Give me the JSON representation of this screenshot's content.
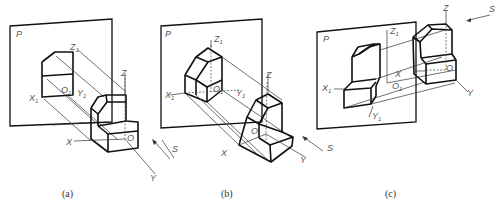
{
  "figure": {
    "panels": [
      {
        "id": "a",
        "caption": "(a)",
        "plane_label": "P",
        "axes_3d": {
          "x": "X",
          "y": "Y",
          "z": "Z",
          "origin": "O"
        },
        "axes_projected": {
          "x": "X1",
          "y": "Y1",
          "z": "Z1",
          "origin": "O1"
        },
        "direction_label": "S"
      },
      {
        "id": "b",
        "caption": "(b)",
        "plane_label": "P",
        "axes_3d": {
          "x": "X",
          "y": "Y",
          "z": "Z",
          "origin": "O"
        },
        "axes_projected": {
          "x": "X1",
          "y": "Y1",
          "z": "Z1",
          "origin": "O1"
        },
        "direction_label": "S"
      },
      {
        "id": "c",
        "caption": "(c)",
        "plane_label": "P",
        "axes_3d": {
          "x": "X",
          "y": "Y",
          "z": "Z",
          "origin": "O"
        },
        "axes_projected": {
          "x": "X1",
          "y": "Y1",
          "z": "Z1",
          "origin": "O1"
        },
        "direction_label": "S"
      }
    ]
  }
}
